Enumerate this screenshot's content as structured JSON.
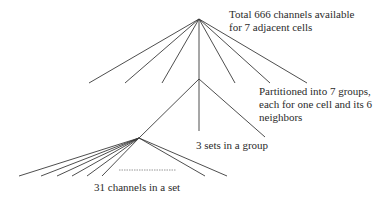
{
  "diagram": {
    "title": "",
    "line_color": "#3a3a3a",
    "dash_color": "#8a8a8a",
    "nodes": {
      "root": {
        "x": 199,
        "y": 19
      },
      "group": {
        "x": 199,
        "y": 79
      },
      "set": {
        "x": 139,
        "y": 138
      }
    },
    "level1_endpoints": [
      {
        "x": 89,
        "y": 83
      },
      {
        "x": 125,
        "y": 83
      },
      {
        "x": 162,
        "y": 83
      },
      {
        "x": 199,
        "y": 79
      },
      {
        "x": 235,
        "y": 83
      },
      {
        "x": 270,
        "y": 83
      },
      {
        "x": 307,
        "y": 83
      }
    ],
    "level2_endpoints": [
      {
        "x": 139,
        "y": 138
      },
      {
        "x": 199,
        "y": 131
      },
      {
        "x": 265,
        "y": 137
      }
    ],
    "level3_endpoints": [
      {
        "x": 19,
        "y": 176
      },
      {
        "x": 41,
        "y": 176
      },
      {
        "x": 57,
        "y": 176
      },
      {
        "x": 72,
        "y": 176
      },
      {
        "x": 87,
        "y": 176
      },
      {
        "x": 102,
        "y": 176
      },
      {
        "x": 205,
        "y": 176
      },
      {
        "x": 227,
        "y": 176
      }
    ],
    "ellipsis_dash": {
      "x1": 119,
      "x2": 176,
      "y": 170
    },
    "labels": {
      "total": {
        "lines": [
          "Total 666 channels available",
          "for 7 adjacent cells"
        ]
      },
      "partitioned": {
        "lines": [
          "Partitioned into 7 groups,",
          "each for one cell and its 6",
          "neighbors"
        ]
      },
      "sets_in_group": {
        "lines": [
          "3 sets in a group"
        ]
      },
      "channels_in_set": {
        "lines": [
          "31 channels in a set"
        ]
      }
    }
  }
}
